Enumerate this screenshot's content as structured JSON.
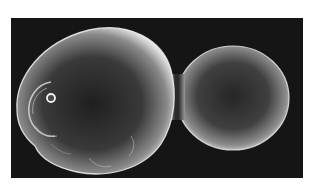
{
  "image": {
    "subject": "budding yeast cell (scanning electron micrograph)",
    "description": "Large mother cell on the left connected by a narrow neck to a smaller round daughter bud on the right, against a dark background",
    "colors": {
      "background": "#151515",
      "page": "#ffffff",
      "cell_edge_highlight": "#f2f2f2",
      "cell_body_dark": "#2a2a2a",
      "cell_body_mid": "#6e6e6e"
    },
    "features": [
      {
        "name": "mother-cell",
        "label": "Mother cell"
      },
      {
        "name": "daughter-bud",
        "label": "Daughter bud"
      },
      {
        "name": "bud-neck",
        "label": "Bud neck"
      },
      {
        "name": "bud-scar",
        "label": "Bud scar"
      },
      {
        "name": "birth-scar-ring",
        "label": "Small ring"
      }
    ]
  }
}
